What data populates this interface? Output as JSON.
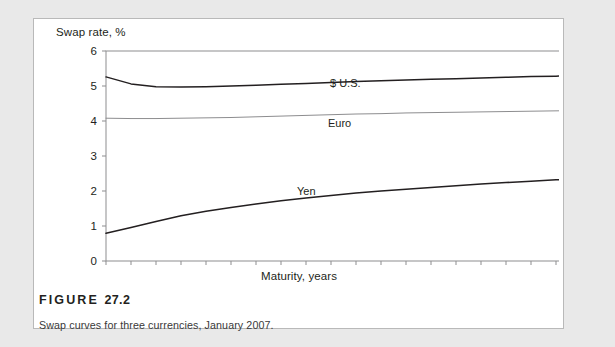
{
  "figure": {
    "number_prefix": "FIGURE",
    "number": "27.2",
    "caption": "Swap curves for three currencies, January 2007."
  },
  "chart_data": {
    "type": "line",
    "title": "",
    "xlabel": "Maturity, years",
    "ylabel": "Swap rate, %",
    "xlim": [
      1,
      20
    ],
    "ylim": [
      0,
      6
    ],
    "xticks": [
      1,
      2,
      3,
      4,
      5,
      6,
      7,
      8,
      9,
      10,
      11,
      12,
      13,
      14,
      15,
      16,
      17,
      18,
      19,
      20
    ],
    "yticks": [
      0,
      1,
      2,
      3,
      4,
      5,
      6
    ],
    "xtick_labels": [
      "1",
      "2",
      "3",
      "4",
      "5",
      "6",
      "7",
      "8",
      "9",
      "10",
      "11",
      "12",
      "13",
      "14",
      "15",
      "16",
      "17",
      "18",
      "19",
      "20"
    ],
    "ytick_labels": [
      "0",
      "1",
      "2",
      "3",
      "4",
      "5",
      "6"
    ],
    "grid": false,
    "legend_position": "inline-labels",
    "x": [
      1,
      2,
      3,
      4,
      5,
      6,
      7,
      8,
      9,
      10,
      11,
      12,
      13,
      14,
      15,
      16,
      17,
      18,
      19,
      20
    ],
    "series": [
      {
        "name": "$ U.S.",
        "color": "#231f20",
        "values": [
          5.26,
          5.06,
          4.98,
          4.97,
          4.98,
          5.0,
          5.02,
          5.05,
          5.07,
          5.1,
          5.13,
          5.15,
          5.17,
          5.19,
          5.21,
          5.23,
          5.25,
          5.27,
          5.28,
          5.3
        ]
      },
      {
        "name": "Euro",
        "color": "#8d8d8f",
        "values": [
          4.08,
          4.07,
          4.07,
          4.08,
          4.09,
          4.1,
          4.12,
          4.14,
          4.16,
          4.18,
          4.2,
          4.21,
          4.23,
          4.24,
          4.25,
          4.26,
          4.27,
          4.28,
          4.29,
          4.3
        ]
      },
      {
        "name": "Yen",
        "color": "#231f20",
        "values": [
          0.79,
          0.96,
          1.13,
          1.29,
          1.42,
          1.53,
          1.63,
          1.72,
          1.8,
          1.87,
          1.94,
          2.0,
          2.05,
          2.1,
          2.15,
          2.2,
          2.24,
          2.28,
          2.32,
          2.36
        ]
      }
    ]
  }
}
